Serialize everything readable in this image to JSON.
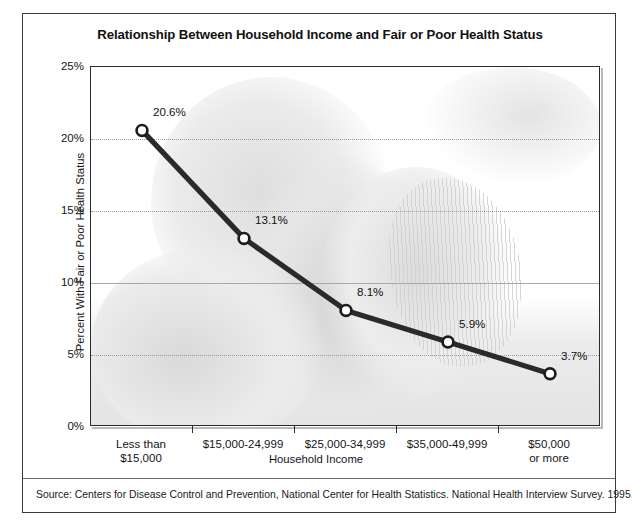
{
  "chart_data": {
    "type": "line",
    "title": "Relationship Between Household Income and Fair or Poor Health Status",
    "xlabel": "Household Income",
    "ylabel": "Percent With Fair or Poor Health Status",
    "categories": [
      "Less than $15,000",
      "$15,000-24,999",
      "$25,000-34,999",
      "$35,000-49,999",
      "$50,000 or more"
    ],
    "category_lines": [
      [
        "Less than",
        "$15,000"
      ],
      [
        "$15,000-24,999",
        ""
      ],
      [
        "$25,000-34,999",
        ""
      ],
      [
        "$35,000-49,999",
        ""
      ],
      [
        "$50,000",
        "or more"
      ]
    ],
    "values": [
      20.6,
      13.1,
      8.1,
      5.9,
      3.7
    ],
    "point_labels": [
      "20.6%",
      "13.1%",
      "8.1%",
      "5.9%",
      "3.7%"
    ],
    "ylim": [
      0,
      25
    ],
    "yticks": [
      0,
      5,
      10,
      15,
      20,
      25
    ],
    "ytick_labels": [
      "0%",
      "5%",
      "10%",
      "15%",
      "20%",
      "25%"
    ],
    "grid": true,
    "legend": "none",
    "series_color": "#2a2a2a",
    "marker_fill": "#ffffff",
    "marker_stroke": "#1d1d1d"
  },
  "footer": {
    "source": "Source:  Centers for Disease Control and Prevention, National Center for Health Statistics. National Health Interview Survey. 1995."
  }
}
